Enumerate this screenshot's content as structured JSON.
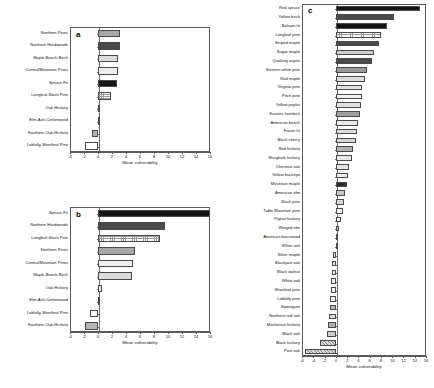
{
  "figure": {
    "xlabel": "Mean vulnerability"
  },
  "chart_data": [
    {
      "type": "bar",
      "panel": "a",
      "orientation": "horizontal",
      "title": "",
      "xlabel": "Mean vulnerability",
      "ylabel": "",
      "xlim": [
        -4,
        16
      ],
      "xticks": [
        -4,
        -2,
        0,
        2,
        4,
        6,
        8,
        10,
        12,
        14,
        16
      ],
      "xticklabels": [
        "-4",
        "-2",
        "0",
        "2",
        "4",
        "6",
        "8",
        "10",
        "12",
        "14",
        "16"
      ],
      "grid": false,
      "legend": "none",
      "categories": [
        "Northern Pines",
        "Northern Hardwoods",
        "Maple-Beech-Birch",
        "Central/Mountain Pines",
        "Spruce-Fir",
        "Longleaf-Slash Pine",
        "Oak-Hickory",
        "Elm-Ash-Cottonwood",
        "Southern Oak-Hickory",
        "Loblolly-Shortleaf Pine"
      ],
      "values": [
        3.2,
        3.1,
        2.9,
        2.8,
        2.7,
        1.9,
        0.15,
        0.05,
        -0.9,
        -1.9
      ],
      "fills": [
        "#a8a8a8",
        "#4a4a4a",
        "#dcdcdc",
        "#eeeeee",
        "#151515",
        "grid",
        "#c9c9c9",
        "#ededed",
        "#b4b4b4",
        "#ffffff"
      ]
    },
    {
      "type": "bar",
      "panel": "b",
      "orientation": "horizontal",
      "title": "",
      "xlabel": "Mean vulnerability",
      "ylabel": "",
      "xlim": [
        -4,
        16
      ],
      "xticks": [
        -4,
        -2,
        0,
        2,
        4,
        6,
        8,
        10,
        12,
        14,
        16
      ],
      "xticklabels": [
        "-4",
        "-2",
        "0",
        "2",
        "4",
        "6",
        "8",
        "10",
        "12",
        "14",
        "16"
      ],
      "grid": false,
      "legend": "none",
      "categories": [
        "Spruce-Fir",
        "Northern Hardwoods",
        "Longleaf-Slash Pine",
        "Northern Pines",
        "Central/Mountain Pines",
        "Maple-Beech-Birch",
        "Oak-Hickory",
        "Elm-Ash-Cottonwood",
        "Loblolly-Shortleaf Pine",
        "Southern Oak-Hickory"
      ],
      "values": [
        16.0,
        9.5,
        8.8,
        5.3,
        5.0,
        4.9,
        0.6,
        0.1,
        -1.1,
        -1.8
      ],
      "fills": [
        "#151515",
        "#4a4a4a",
        "grid",
        "#a8a8a8",
        "#eeeeee",
        "#dcdcdc",
        "#ededed",
        "#d6d6d6",
        "#ffffff",
        "#b4b4b4"
      ]
    },
    {
      "type": "bar",
      "panel": "c",
      "orientation": "horizontal",
      "title": "",
      "xlabel": "Mean vulnerability",
      "ylabel": "",
      "xlim": [
        -6,
        16
      ],
      "xticks": [
        -6,
        -4,
        -2,
        0,
        2,
        4,
        6,
        8,
        10,
        12,
        14,
        16
      ],
      "xticklabels": [
        "-6",
        "-4",
        "-2",
        "0",
        "2",
        "4",
        "6",
        "8",
        "10",
        "12",
        "14",
        "16"
      ],
      "grid": false,
      "legend": "none",
      "categories": [
        "Red spruce",
        "Yellow birch",
        "Balsam fir",
        "Longleaf pine",
        "Striped maple",
        "Sugar maple",
        "Quaking aspen",
        "Eastern white pine",
        "Red maple",
        "Virginia pine",
        "Pitch pine",
        "Yellow poplar",
        "Eastern hemlock",
        "American beech",
        "Fraser fir",
        "Black cherry",
        "Red hickory",
        "Shagbark hickory",
        "Chestnut oak",
        "Yellow buckeye",
        "Mountain maple",
        "American elm",
        "Slash pine",
        "Table Mountain pine",
        "Pignut hickory",
        "Winged elm",
        "American basswood",
        "White ash",
        "Silver maple",
        "Blackjack oak",
        "Black walnut",
        "White oak",
        "Shortleaf pine",
        "Loblolly pine",
        "Sweetgum",
        "Northern red oak",
        "Mockernut hickory",
        "Black oak",
        "Black hickory",
        "Post oak"
      ],
      "values": [
        15.0,
        10.4,
        9.0,
        8.1,
        7.7,
        6.7,
        6.5,
        5.5,
        5.2,
        4.7,
        4.6,
        4.4,
        4.3,
        4.0,
        3.8,
        3.5,
        3.1,
        2.8,
        2.4,
        2.2,
        2.0,
        1.7,
        1.4,
        1.2,
        0.9,
        0.6,
        0.3,
        0.15,
        -0.5,
        -0.6,
        -0.7,
        -0.8,
        -0.9,
        -1.0,
        -1.1,
        -1.2,
        -1.3,
        -1.6,
        -2.8,
        -5.5
      ],
      "fills": [
        "#141414",
        "#4a4a4a",
        "#141414",
        "grid",
        "#4a4a4a",
        "#cfcfcf",
        "#4a4a4a",
        "#9a9a9a",
        "#dcdcdc",
        "#e3e3e3",
        "#f2f2f2",
        "#e0e0e0",
        "#9f9f9f",
        "#eaeaea",
        "#dcdcdc",
        "#d6d6d6",
        "#b0b0b0",
        "#e8e8e8",
        "#e2e2e2",
        "#ededed",
        "#2a2a2a",
        "#c6c6c6",
        "#d9d9d9",
        "#fafafa",
        "#f0f0f0",
        "#b9b9b9",
        "#cfcfcf",
        "#f4f4f4",
        "#ededed",
        "#e6e6e6",
        "#e9e9e9",
        "#efefef",
        "#f2f2f2",
        "#f4f4f4",
        "#b8b8b8",
        "#dcdcdc",
        "#aeaeae",
        "#cfcfcf",
        "hatch",
        "hatch"
      ]
    }
  ]
}
